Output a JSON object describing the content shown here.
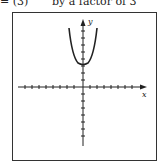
{
  "header": {
    "equation_fragment": "= (3)",
    "caption_fragment": "by a factor of 3"
  },
  "graph": {
    "x_axis_label": "x",
    "y_axis_label": "y",
    "curve": "upward-opening parabola with vertex on positive y-axis",
    "vertex": [
      0,
      3
    ],
    "ticks_per_half_axis": 8
  },
  "colors": {
    "ink": "#222222",
    "background": "#ffffff"
  }
}
